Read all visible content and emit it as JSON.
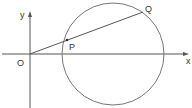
{
  "diagram": {
    "labels": {
      "y_axis": "y",
      "x_axis": "x",
      "origin": "O",
      "point_p": "P",
      "point_q": "Q"
    },
    "colors": {
      "stroke": "#555555",
      "background": "#ffffff"
    }
  }
}
